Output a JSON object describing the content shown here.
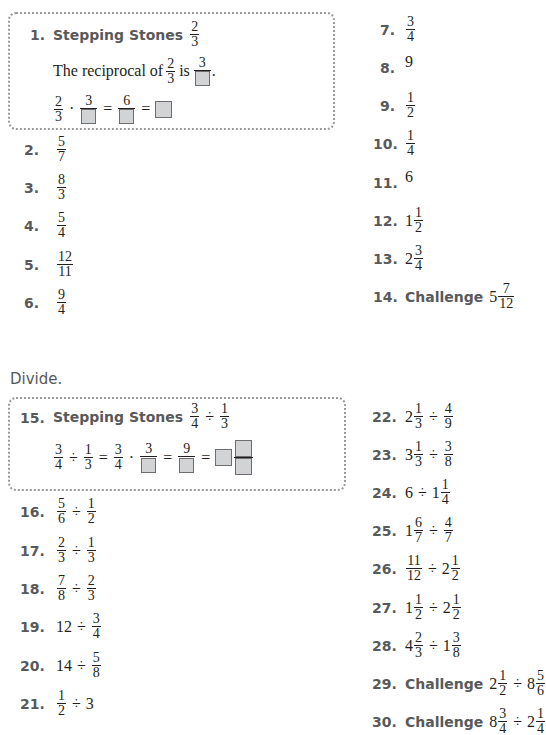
{
  "section1": {
    "stepping": {
      "number": "1.",
      "label": "Stepping Stones",
      "answer": {
        "n": "2",
        "d": "3"
      },
      "line1_text": "The reciprocal of",
      "line1_frac": {
        "n": "2",
        "d": "3"
      },
      "line1_is": "is",
      "line1_recip_n": "3",
      "line2": {
        "a_n": "2",
        "a_d": "3",
        "b_n": "3",
        "c_n": "6"
      }
    },
    "items": [
      {
        "number": "2.",
        "n": "5",
        "d": "7"
      },
      {
        "number": "3.",
        "n": "8",
        "d": "3"
      },
      {
        "number": "4.",
        "n": "5",
        "d": "4"
      },
      {
        "number": "5.",
        "n": "12",
        "d": "11"
      },
      {
        "number": "6.",
        "n": "9",
        "d": "4"
      },
      {
        "number": "7.",
        "n": "3",
        "d": "4"
      },
      {
        "number": "8.",
        "value": "9"
      },
      {
        "number": "9.",
        "n": "1",
        "d": "2"
      },
      {
        "number": "10.",
        "n": "1",
        "d": "4"
      },
      {
        "number": "11.",
        "value": "6"
      },
      {
        "number": "12.",
        "whole": "1",
        "n": "1",
        "d": "2"
      },
      {
        "number": "13.",
        "whole": "2",
        "n": "3",
        "d": "4"
      },
      {
        "number": "14.",
        "challenge": "Challenge",
        "whole": "5",
        "n": "7",
        "d": "12"
      }
    ]
  },
  "section2": {
    "heading": "Divide.",
    "stepping": {
      "number": "15.",
      "label": "Stepping Stones",
      "q": {
        "a_n": "3",
        "a_d": "4",
        "op": "÷",
        "b_n": "1",
        "b_d": "3"
      },
      "work": {
        "a_n": "3",
        "a_d": "4",
        "b_n": "1",
        "b_d": "3",
        "c_n": "3",
        "c_d": "4",
        "d_n": "3",
        "e_n": "9"
      }
    },
    "items": [
      {
        "number": "16.",
        "expr": "5/6 ÷ 1/2"
      },
      {
        "number": "17.",
        "expr": "2/3 ÷ 1/3"
      },
      {
        "number": "18.",
        "expr": "7/8 ÷ 2/3"
      },
      {
        "number": "19.",
        "expr": "12 ÷ 3/4"
      },
      {
        "number": "20.",
        "expr": "14 ÷ 5/8"
      },
      {
        "number": "21.",
        "expr": "1/2 ÷ 3"
      },
      {
        "number": "22.",
        "expr": "2 1/3 ÷ 4/9"
      },
      {
        "number": "23.",
        "expr": "3 1/3 ÷ 3/8"
      },
      {
        "number": "24.",
        "expr": "6 ÷ 1 1/4"
      },
      {
        "number": "25.",
        "expr": "1 6/7 ÷ 4/7"
      },
      {
        "number": "26.",
        "expr": "11/12 ÷ 2 1/2"
      },
      {
        "number": "27.",
        "expr": "1 1/2 ÷ 2 1/2"
      },
      {
        "number": "28.",
        "expr": "4 2/3 ÷ 1 3/8"
      },
      {
        "number": "29.",
        "challenge": "Challenge",
        "expr": "2 1/2 ÷ 8 5/6"
      },
      {
        "number": "30.",
        "challenge": "Challenge",
        "expr": "8 3/4 ÷ 2 1/4"
      }
    ]
  },
  "symbols": {
    "div": "÷",
    "dot": "·",
    "eq": "=",
    "period": "."
  }
}
